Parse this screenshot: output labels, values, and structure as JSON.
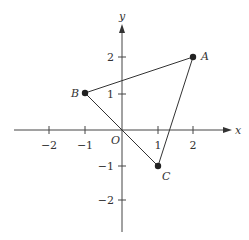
{
  "axes": {
    "x_label": "x",
    "y_label": "y",
    "origin_label": "O",
    "x_ticks": [
      "−2",
      "−1",
      "1",
      "2"
    ],
    "y_ticks": [
      "2",
      "1",
      "−1",
      "−2"
    ]
  },
  "points": [
    {
      "name": "A",
      "x": 2,
      "y": 2
    },
    {
      "name": "B",
      "x": -1,
      "y": 1
    },
    {
      "name": "C",
      "x": 1,
      "y": -1
    }
  ],
  "triangle": "ABC"
}
